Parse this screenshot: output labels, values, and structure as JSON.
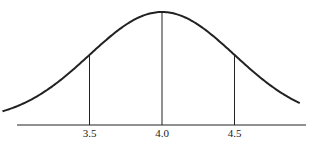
{
  "chart_data": {
    "type": "line",
    "title": "",
    "xlabel": "",
    "ylabel": "",
    "mean": 4.0,
    "std_dev": 0.5,
    "x_ticks": [
      3.5,
      4.0,
      4.5
    ],
    "x_tick_labels": [
      "3.5",
      "4.0",
      "4.5"
    ],
    "vertical_markers": [
      3.5,
      4.0,
      4.5
    ],
    "xlim": [
      2.9,
      4.95
    ],
    "grid": false,
    "legend": null
  },
  "colors": {
    "stroke": "#222222",
    "background": "#ffffff"
  }
}
